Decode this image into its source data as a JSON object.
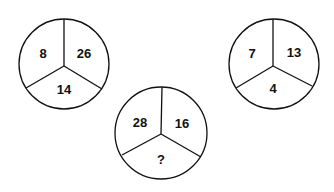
{
  "puzzle": {
    "circles": [
      {
        "cx": 64,
        "cy": 64,
        "r": 45,
        "segments": {
          "left": "8",
          "right": "26",
          "bottom": "14"
        }
      },
      {
        "cx": 161,
        "cy": 133,
        "r": 46,
        "segments": {
          "left": "28",
          "right": "16",
          "bottom": "?"
        }
      },
      {
        "cx": 274,
        "cy": 64,
        "r": 45,
        "segments": {
          "left": "7",
          "right": "13",
          "bottom": "4"
        }
      }
    ],
    "colors": {
      "stroke": "#111111",
      "fill": "#ffffff",
      "text": "#111111"
    }
  }
}
